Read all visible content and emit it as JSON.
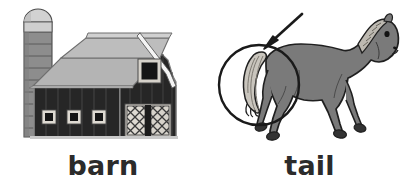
{
  "page": {
    "type": "vocabulary-flashcard-pair",
    "background_color": "#ffffff",
    "width": 413,
    "height": 192
  },
  "cards": [
    {
      "id": "barn",
      "label": "barn",
      "illustration": "barn-illustration",
      "parts": [
        {
          "name": "silo",
          "color": "#8d8d8d",
          "detail": "cylindrical tower with domed light top and horizontal bands"
        },
        {
          "name": "roof",
          "color": "#b4b4b4",
          "detail": "gambrel roof, light gray with ridge trim"
        },
        {
          "name": "wall",
          "color": "#262626",
          "detail": "dark vertical plank siding"
        },
        {
          "name": "hayloft-window",
          "color": "#1a1a1a",
          "detail": "square window with light frame"
        },
        {
          "name": "ground-windows",
          "count": 3,
          "color": "#1a1a1a",
          "detail": "three small square windows with light frames"
        },
        {
          "name": "barn-doors",
          "color": "#d7d3cb",
          "detail": "double doors with cross-hatch lattice pattern"
        }
      ]
    },
    {
      "id": "tail",
      "label": "tail",
      "illustration": "horse-illustration",
      "annotation": {
        "circle": {
          "name": "highlight-circle",
          "color": "#1a1a1a",
          "target": "tail"
        },
        "arrow": {
          "name": "pointer-arrow",
          "color": "#1a1a1a",
          "direction": "down-left"
        }
      },
      "parts": [
        {
          "name": "body",
          "color": "#7a7a7a",
          "detail": "horse body, medium gray with dark outline"
        },
        {
          "name": "tail",
          "color": "#c9c5bd",
          "detail": "light flowing tail with darker strand lines"
        },
        {
          "name": "mane",
          "color": "#bdb9b1",
          "detail": "braided light mane along the neck"
        },
        {
          "name": "hooves",
          "color": "#333333",
          "detail": "four dark hooves"
        },
        {
          "name": "eye",
          "color": "#1a1a1a",
          "detail": "dark eye"
        }
      ]
    }
  ],
  "colors": {
    "background": "#ffffff",
    "text": "#2b2b2b",
    "outline": "#1a1a1a",
    "barn_wall": "#262626",
    "barn_roof": "#b4b4b4",
    "silo": "#8d8d8d",
    "horse_body": "#7a7a7a",
    "horse_tail": "#c9c5bd"
  }
}
